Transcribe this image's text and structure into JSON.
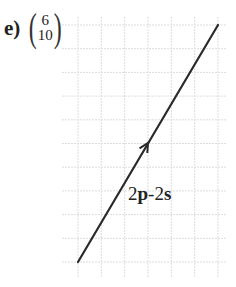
{
  "question": {
    "part_label": "e)",
    "vector": {
      "top": "6",
      "bottom": "10"
    }
  },
  "diagram": {
    "grid": {
      "cell_px": 23.5,
      "color": "#dddddd",
      "x_lines": [
        78,
        101.3,
        124.7,
        148,
        171.3,
        194.7,
        218
      ],
      "y_lines": [
        25,
        48.7,
        72.4,
        96.1,
        119.8,
        143.5,
        167.2,
        190.9,
        214.6,
        238.3,
        262
      ]
    },
    "vector_line": {
      "start": [
        78,
        262
      ],
      "end": [
        218,
        25
      ],
      "arrow_at": [
        148,
        143
      ],
      "components": {
        "dx": 6,
        "dy": 10
      },
      "color": "#2a2a2a"
    },
    "expression": {
      "coef1": "2",
      "var1": "p",
      "op": "-",
      "coef2": "2",
      "var2": "s"
    }
  }
}
